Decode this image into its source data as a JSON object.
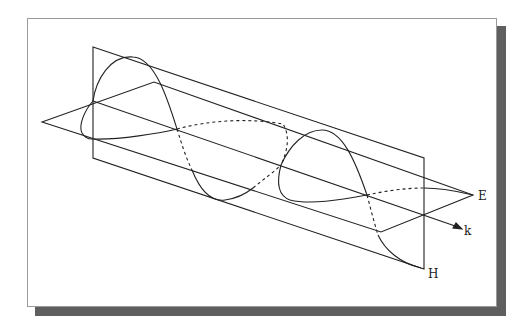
{
  "figure": {
    "labels": {
      "electric_field": "E",
      "magnetic_field": "H",
      "propagation": "k"
    },
    "colors": {
      "line": "#222222",
      "frame_border": "#9a9a9a",
      "shadow": "#5f5f5f",
      "background": "#ffffff"
    }
  }
}
